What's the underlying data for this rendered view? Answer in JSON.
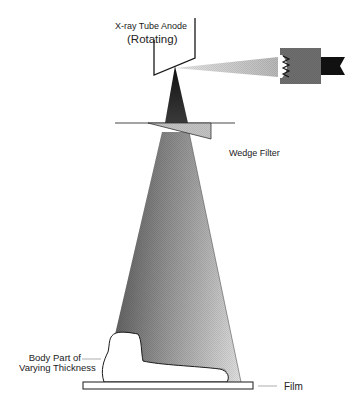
{
  "figure": {
    "type": "schematic",
    "labels": {
      "anode_line1": "X-ray Tube Anode",
      "anode_line2": "(Rotating)",
      "wedge_filter": "Wedge Filter",
      "body_part_line1": "Body Part of",
      "body_part_line2": "Varying Thickness",
      "film": "Film"
    },
    "colors": {
      "background": "#ffffff",
      "line": "#1a1a1a",
      "beam_dark": "#2a2a2a",
      "beam_mid": "#7a7a7a",
      "beam_light": "#d8d8d8",
      "cathode_body": "#6e6e6e",
      "cathode_tab": "#111111",
      "wedge_fill": "#bdbdbd",
      "electron_stream": "#c8c8c8"
    },
    "components": [
      "anode",
      "cathode",
      "electron-stream",
      "primary-beam",
      "wedge-filter",
      "body-part",
      "film"
    ]
  }
}
